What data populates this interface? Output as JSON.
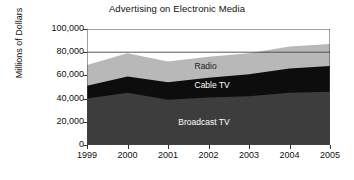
{
  "chart_data": {
    "type": "area",
    "stacked": true,
    "title": "Advertising on Electronic Media",
    "xlabel": "",
    "ylabel": "Millions of Dollars",
    "x": [
      1999,
      2000,
      2001,
      2002,
      2003,
      2004,
      2005
    ],
    "categories": [
      "1999",
      "2000",
      "2001",
      "2002",
      "2003",
      "2004",
      "2005"
    ],
    "ylim": [
      0,
      100000
    ],
    "yticks": [
      0,
      20000,
      40000,
      60000,
      80000,
      100000
    ],
    "ytick_labels": [
      "0",
      "20,000",
      "40,000",
      "60,000",
      "80,000",
      "100,000"
    ],
    "grid": false,
    "legend_position": "inline-annotations",
    "series": [
      {
        "name": "Broadcast TV",
        "color": "#3d3d3d",
        "values": [
          40000,
          45000,
          39000,
          41000,
          42000,
          45000,
          46000
        ]
      },
      {
        "name": "Cable TV",
        "color": "#0d0d0d",
        "values": [
          11000,
          14000,
          15000,
          17000,
          19000,
          21000,
          22000
        ]
      },
      {
        "name": "Radio",
        "color": "#b8b8b8",
        "values": [
          18000,
          20000,
          18000,
          18000,
          18000,
          19000,
          19000
        ]
      }
    ],
    "cumulative_totals": [
      69000,
      79000,
      72000,
      76000,
      79000,
      85000,
      87000
    ],
    "annotations": [
      {
        "text": "Radio",
        "x": 2002,
        "y": 67000
      },
      {
        "text": "Cable TV",
        "x": 2002,
        "y": 51000
      },
      {
        "text": "Broadcast TV",
        "x": 2001.6,
        "y": 19000
      }
    ]
  },
  "colors": {
    "background": "#ffffff",
    "axis": "#333333",
    "text": "#111111",
    "broadcast_tv": "#3d3d3d",
    "cable_tv": "#0d0d0d",
    "radio": "#b8b8b8",
    "plot_fill": "#ffffff",
    "label_light": "#ffffff",
    "label_dark": "#1a1a1a"
  }
}
